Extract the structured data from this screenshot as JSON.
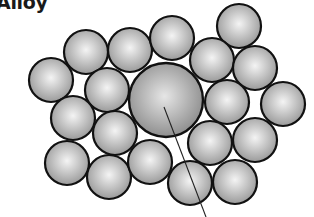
{
  "title": "Alloy",
  "diagram": {
    "type": "substitutional-alloy-atom-packing",
    "colors": {
      "atom_fill_center": "#f4f4f4",
      "atom_fill_edge": "#9a9a9a",
      "solute_fill_center": "#e6e6e6",
      "solute_fill_edge": "#8a8a8a",
      "outline": "#111111",
      "pointer_line": "#222222"
    },
    "solute_atom": {
      "cx": 166,
      "cy": 100,
      "r": 37
    },
    "host_atoms": [
      {
        "cx": 239,
        "cy": 26,
        "r": 22
      },
      {
        "cx": 86,
        "cy": 52,
        "r": 22
      },
      {
        "cx": 130,
        "cy": 50,
        "r": 22
      },
      {
        "cx": 172,
        "cy": 38,
        "r": 22
      },
      {
        "cx": 212,
        "cy": 60,
        "r": 22
      },
      {
        "cx": 255,
        "cy": 68,
        "r": 22
      },
      {
        "cx": 51,
        "cy": 80,
        "r": 22
      },
      {
        "cx": 107,
        "cy": 90,
        "r": 22
      },
      {
        "cx": 227,
        "cy": 102,
        "r": 22
      },
      {
        "cx": 283,
        "cy": 104,
        "r": 22
      },
      {
        "cx": 73,
        "cy": 118,
        "r": 22
      },
      {
        "cx": 115,
        "cy": 133,
        "r": 22
      },
      {
        "cx": 210,
        "cy": 143,
        "r": 22
      },
      {
        "cx": 255,
        "cy": 140,
        "r": 22
      },
      {
        "cx": 67,
        "cy": 163,
        "r": 22
      },
      {
        "cx": 109,
        "cy": 177,
        "r": 22
      },
      {
        "cx": 150,
        "cy": 162,
        "r": 22
      },
      {
        "cx": 190,
        "cy": 183,
        "r": 22
      },
      {
        "cx": 235,
        "cy": 182,
        "r": 22
      }
    ],
    "pointer_line": {
      "x1": 164,
      "y1": 107,
      "x2": 206,
      "y2": 217
    }
  }
}
